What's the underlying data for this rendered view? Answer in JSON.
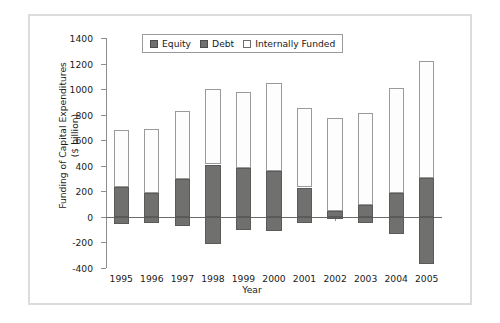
{
  "figure": {
    "background_color": "#ffffff",
    "frame_color": "#dcdcdc"
  },
  "chart_data": {
    "type": "bar",
    "subtype": "stacked-bar-with-negatives",
    "title": "",
    "xlabel": "Year",
    "ylabel": "Funding of Capital Expenditures\n($ billion)",
    "categories": [
      "1995",
      "1996",
      "1997",
      "1998",
      "1999",
      "2000",
      "2001",
      "2002",
      "2003",
      "2004",
      "2005"
    ],
    "ylim": [
      -400,
      1400
    ],
    "ytick_step": 200,
    "yticks": [
      1400,
      1200,
      1000,
      800,
      600,
      400,
      200,
      0,
      -200,
      -400
    ],
    "ytick_labels": [
      "1400",
      "1200",
      "1000",
      "800",
      "600",
      "400",
      "200",
      "0",
      "-200",
      "-400"
    ],
    "grid": false,
    "legend_position": "upper-left-inside",
    "series": [
      {
        "name": "Equity",
        "color": "#70706f",
        "values": [
          -55,
          -45,
          -75,
          -210,
          -105,
          -110,
          -45,
          -20,
          -50,
          -135,
          -365
        ]
      },
      {
        "name": "Debt",
        "color": "#70706f",
        "values": [
          235,
          190,
          300,
          410,
          385,
          360,
          230,
          45,
          95,
          190,
          305
        ]
      },
      {
        "name": "Internally Funded",
        "color": "#ffffff",
        "values": [
          445,
          500,
          525,
          590,
          590,
          690,
          625,
          730,
          720,
          815,
          915
        ]
      }
    ],
    "stacked_positive_totals": [
      680,
      690,
      825,
      1000,
      975,
      1050,
      855,
      775,
      815,
      1005,
      1220
    ]
  },
  "legend": {
    "items": [
      {
        "label": "Equity",
        "swatch": "filled-gray-square",
        "color": "#70706f"
      },
      {
        "label": "Debt",
        "swatch": "filled-gray-square",
        "color": "#70706f"
      },
      {
        "label": "Internally Funded",
        "swatch": "open-white-square",
        "color": "#ffffff"
      }
    ]
  }
}
